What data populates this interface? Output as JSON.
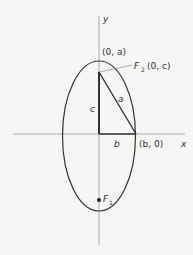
{
  "diagram": {
    "type": "ellipse-foci",
    "axes": {
      "x_label": "x",
      "y_label": "y"
    },
    "labels": {
      "top_vertex": "(0, a)",
      "focus2_name": "F",
      "focus2_sub": "2",
      "focus2_coords": "(0, c)",
      "side_c": "c",
      "side_a": "a",
      "side_b": "b",
      "right_vertex": "(b, 0)",
      "focus1_name": "F",
      "focus1_sub": "1"
    },
    "colors": {
      "stroke": "#333333",
      "axis": "#9a9a9a",
      "background": "#f6f6f4"
    }
  }
}
